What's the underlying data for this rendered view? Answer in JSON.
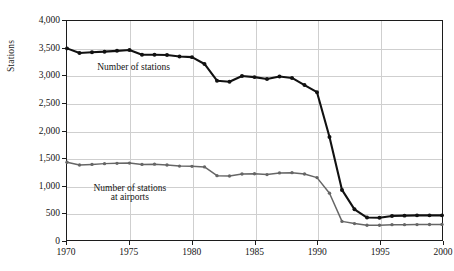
{
  "chart_data": {
    "type": "line",
    "title": "",
    "subtitle": "",
    "xlabel": "",
    "ylabel": "Stations",
    "xlim": [
      1970,
      2000
    ],
    "ylim": [
      0,
      4000
    ],
    "grid": true,
    "legend_position": "inline-annotations",
    "xticks": [
      "1970",
      "1975",
      "1980",
      "1985",
      "1990",
      "1995",
      "2000"
    ],
    "xtick_values": [
      1970,
      1975,
      1980,
      1985,
      1990,
      1995,
      2000
    ],
    "yticks": [
      "0",
      "500",
      "1,000",
      "1,500",
      "2,000",
      "2,500",
      "3,000",
      "3,500",
      "4,000"
    ],
    "ytick_values": [
      0,
      500,
      1000,
      1500,
      2000,
      2500,
      3000,
      3500,
      4000
    ],
    "x": [
      1970,
      1971,
      1972,
      1973,
      1974,
      1975,
      1976,
      1977,
      1978,
      1979,
      1980,
      1981,
      1982,
      1983,
      1984,
      1985,
      1986,
      1987,
      1988,
      1989,
      1990,
      1991,
      1992,
      1993,
      1994,
      1995,
      1996,
      1997,
      1998,
      1999,
      2000
    ],
    "series": [
      {
        "name": "Number of stations",
        "color": "#111111",
        "marker": "circle",
        "values": [
          3500,
          3415,
          3430,
          3440,
          3455,
          3470,
          3385,
          3385,
          3380,
          3350,
          3340,
          3215,
          2910,
          2890,
          2995,
          2975,
          2940,
          2985,
          2960,
          2830,
          2700,
          1880,
          915,
          560,
          410,
          405,
          440,
          445,
          450,
          450,
          450
        ]
      },
      {
        "name": "Number of stations at airports",
        "color": "#666666",
        "marker": "circle",
        "values": [
          1420,
          1370,
          1380,
          1395,
          1400,
          1405,
          1380,
          1385,
          1370,
          1350,
          1345,
          1335,
          1175,
          1170,
          1205,
          1210,
          1195,
          1225,
          1230,
          1205,
          1140,
          855,
          340,
          300,
          270,
          270,
          280,
          280,
          282,
          283,
          285
        ]
      }
    ],
    "annotations": [
      {
        "text": "Number of stations",
        "x": 1975.3,
        "y": 3150
      },
      {
        "text": "Number of stations",
        "x": 1975.0,
        "y": 960
      },
      {
        "text": "at airports",
        "x": 1975.0,
        "y": 790
      }
    ]
  }
}
